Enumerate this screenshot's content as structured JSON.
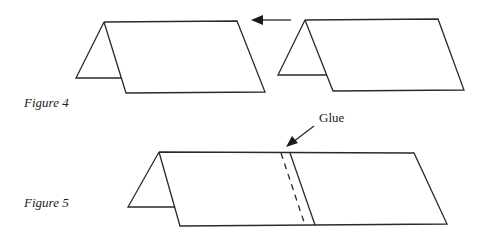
{
  "figures": [
    {
      "label": "Figure 4",
      "description": "Two folded tent-shaped paper pieces; right piece moved leftward toward left piece"
    },
    {
      "label": "Figure 5",
      "description": "Two pieces joined into one long tent, glued at the overlap"
    }
  ],
  "annotations": {
    "glue_label": "Glue",
    "move_arrow": "left-arrow-icon"
  },
  "colors": {
    "line": "#2a2a2a",
    "background": "#ffffff"
  }
}
